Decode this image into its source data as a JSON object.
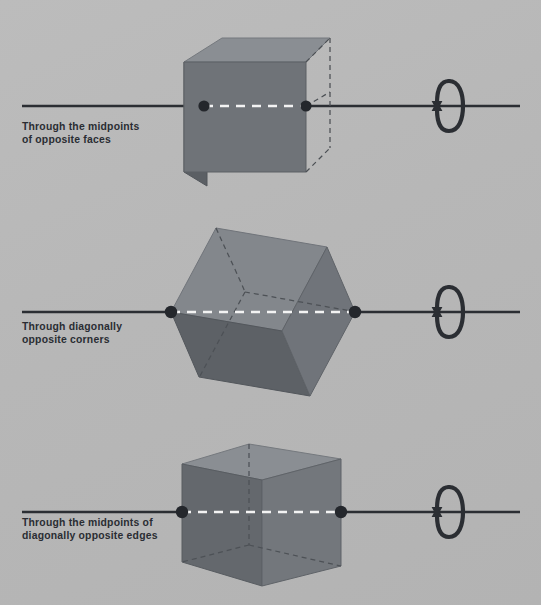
{
  "figure": {
    "background_color": "#b7b7b7",
    "width": 541,
    "height": 605
  },
  "palette": {
    "axis_line": "#2b2e33",
    "vertex_dot": "#24272c",
    "hidden_edge_dash": "#4a4d52",
    "center_dash": "#f2f2f2",
    "cube_front": "#6e7277",
    "cube_top": "#878b90",
    "cube_side": "#5a5e63",
    "cube_edge": "#4e5257",
    "text": "#2a2d33"
  },
  "panels": [
    {
      "id": "midpoints-of-faces",
      "label": "Through the midpoints\nof opposite faces",
      "axis_type": "face-midpoints",
      "rotation_order": 4,
      "axis_y": 106,
      "axis_x_start": 22,
      "axis_x_end": 520,
      "pierce_points": [
        [
          204,
          106
        ],
        [
          306,
          106
        ]
      ],
      "arrow_center": [
        450,
        106
      ],
      "cube": {
        "orientation": "axis-through-face-centers",
        "front_face": [
          [
            184,
            62
          ],
          [
            306,
            62
          ],
          [
            306,
            172
          ],
          [
            184,
            172
          ]
        ],
        "top_face": [
          [
            184,
            62
          ],
          [
            222,
            38
          ],
          [
            330,
            38
          ],
          [
            306,
            62
          ]
        ],
        "side_face": [
          [
            184,
            62
          ],
          [
            184,
            172
          ],
          [
            207,
            186
          ],
          [
            207,
            76
          ]
        ],
        "hidden_edges": [
          [
            [
              306,
              62
            ],
            [
              330,
              38
            ]
          ],
          [
            [
              306,
              172
            ],
            [
              330,
              148
            ]
          ],
          [
            [
              330,
              38
            ],
            [
              330,
              148
            ]
          ]
        ]
      }
    },
    {
      "id": "diagonally-opposite-corners",
      "label": "Through diagonally\nopposite corners",
      "axis_type": "body-diagonal",
      "rotation_order": 3,
      "axis_y": 312,
      "axis_x_start": 22,
      "axis_x_end": 520,
      "pierce_points": [
        [
          171,
          312
        ],
        [
          355,
          312
        ]
      ],
      "arrow_center": [
        450,
        312
      ],
      "cube": {
        "orientation": "axis-through-opposite-vertices",
        "silhouette": [
          [
            171,
            312
          ],
          [
            216,
            228
          ],
          [
            327,
            247
          ],
          [
            355,
            312
          ],
          [
            310,
            396
          ],
          [
            199,
            377
          ]
        ],
        "visible_faces": [
          [
            [
              171,
              312
            ],
            [
              216,
              228
            ],
            [
              327,
              247
            ],
            [
              282,
              331
            ]
          ],
          [
            [
              171,
              312
            ],
            [
              282,
              331
            ],
            [
              310,
              396
            ],
            [
              199,
              377
            ]
          ],
          [
            [
              282,
              331
            ],
            [
              327,
              247
            ],
            [
              355,
              312
            ],
            [
              310,
              396
            ]
          ]
        ],
        "hidden_edges": [
          [
            [
              216,
              228
            ],
            [
              245,
              292
            ]
          ],
          [
            [
              245,
              292
            ],
            [
              355,
              312
            ]
          ],
          [
            [
              245,
              292
            ],
            [
              199,
              377
            ]
          ]
        ]
      }
    },
    {
      "id": "midpoints-of-edges",
      "label": "Through the midpoints of\ndiagonally opposite edges",
      "axis_type": "edge-midpoints",
      "rotation_order": 2,
      "axis_y": 512,
      "axis_x_start": 22,
      "axis_x_end": 520,
      "pierce_points": [
        [
          182,
          512
        ],
        [
          341,
          512
        ]
      ],
      "arrow_center": [
        450,
        512
      ],
      "cube": {
        "orientation": "axis-through-opposite-edge-midpoints",
        "front_left_face": [
          [
            182,
            464
          ],
          [
            262,
            480
          ],
          [
            262,
            586
          ],
          [
            182,
            562
          ]
        ],
        "front_right_face": [
          [
            262,
            480
          ],
          [
            341,
            459
          ],
          [
            341,
            566
          ],
          [
            262,
            586
          ]
        ],
        "top_face": [
          [
            182,
            464
          ],
          [
            249,
            444
          ],
          [
            341,
            459
          ],
          [
            262,
            480
          ]
        ],
        "hidden_edges": [
          [
            [
              249,
              444
            ],
            [
              249,
              545
            ]
          ],
          [
            [
              249,
              545
            ],
            [
              182,
              562
            ]
          ],
          [
            [
              249,
              545
            ],
            [
              341,
              566
            ]
          ]
        ]
      }
    }
  ],
  "rotation_arrow": {
    "name": "rotation-arrow",
    "description": "double-headed curved arrow wrapping the axis",
    "ellipse_rx": 13,
    "ellipse_ry": 25
  }
}
